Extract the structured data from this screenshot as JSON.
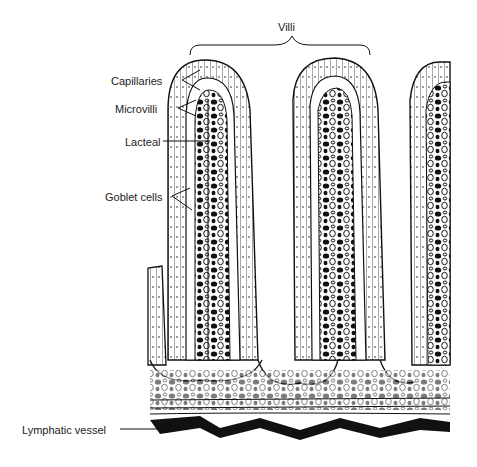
{
  "figure": {
    "labels": {
      "villi": "Villi",
      "capillaries": "Capillaries",
      "microvilli": "Microvilli",
      "lacteal": "Lacteal",
      "goblet_cells": "Goblet cells",
      "lymphatic_vessel": "Lymphatic vessel"
    },
    "colors": {
      "ink": "#111111",
      "background": "#ffffff"
    }
  }
}
